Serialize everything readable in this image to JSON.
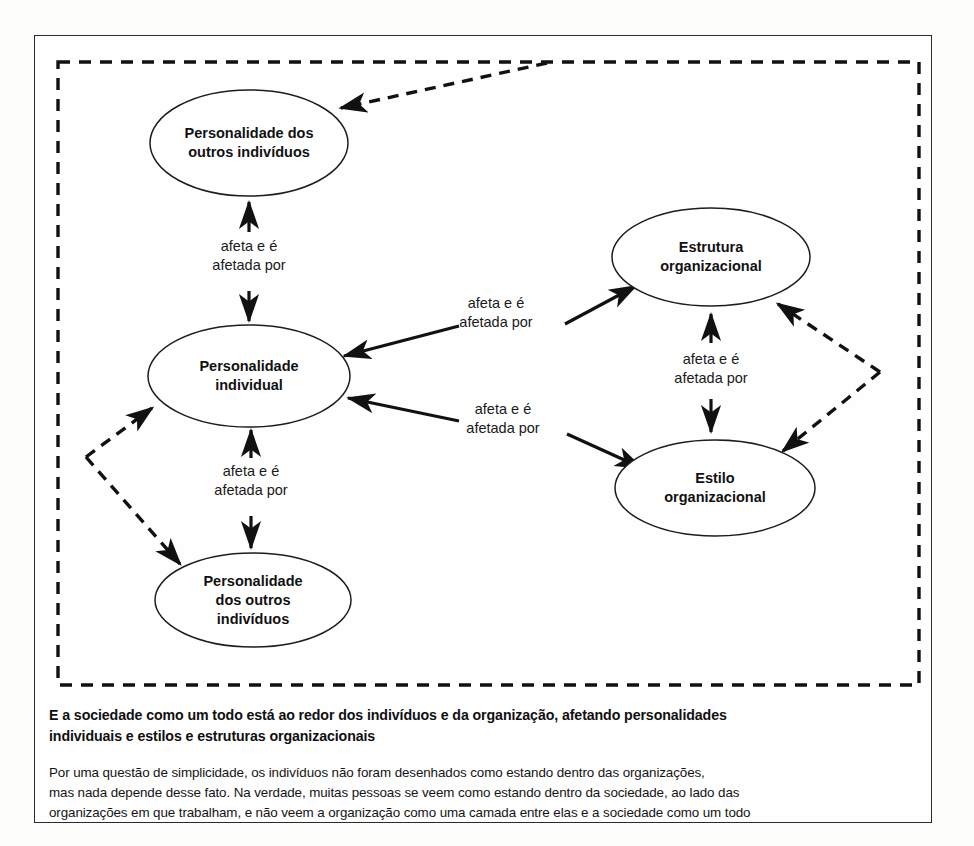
{
  "figure": {
    "type": "relationship-diagram",
    "nodes": [
      {
        "id": "personalidade-outros-topo",
        "lines": [
          "Personalidade dos",
          "outros indivíduos"
        ],
        "cx": 214,
        "cy": 107,
        "rx": 99,
        "ry": 53
      },
      {
        "id": "personalidade-individual",
        "lines": [
          "Personalidade",
          "individual"
        ],
        "cx": 214,
        "cy": 340,
        "rx": 101,
        "ry": 51
      },
      {
        "id": "personalidade-outros-baixo",
        "lines": [
          "Personalidade",
          "dos outros",
          "indivíduos"
        ],
        "cx": 218,
        "cy": 564,
        "rx": 98,
        "ry": 47
      },
      {
        "id": "estrutura-organizacional",
        "lines": [
          "Estrutura",
          "organizacional"
        ],
        "cx": 676,
        "cy": 221,
        "rx": 99,
        "ry": 49
      },
      {
        "id": "estilo-organizacional",
        "lines": [
          "Estilo",
          "organizacional"
        ],
        "cx": 680,
        "cy": 452,
        "rx": 100,
        "ry": 48
      }
    ],
    "edge_labels": [
      {
        "id": "label-topo-esquerda",
        "lines": [
          "afeta e é",
          "afetada por"
        ],
        "x": 214,
        "y": 215
      },
      {
        "id": "label-baixo-esquerda",
        "lines": [
          "afeta e é",
          "afetada por"
        ],
        "x": 216,
        "y": 440
      },
      {
        "id": "label-cruzado-superior",
        "lines": [
          "afeta e é",
          "afetada por"
        ],
        "x": 461,
        "y": 292
      },
      {
        "id": "label-cruzado-inferior",
        "lines": [
          "afeta e é",
          "afetada por"
        ],
        "x": 466,
        "y": 385
      },
      {
        "id": "label-direita-central",
        "lines": [
          "afeta e é",
          "afetada por"
        ],
        "x": 676,
        "y": 328
      }
    ],
    "society_boundary": {
      "id": "sociedade-dashed-boundary",
      "x": 23,
      "y": 26,
      "width": 861,
      "height": 623
    }
  },
  "caption": {
    "bold_lines": [
      "E a sociedade como um todo está ao redor dos indivíduos e da organização, afetando personalidades",
      "individuais e estilos e estruturas organizacionais"
    ],
    "body_lines": [
      "Por uma questão de simplicidade, os indivíduos não foram desenhados como estando dentro das organizações,",
      "mas nada depende desse fato. Na verdade, muitas pessoas se veem como estando dentro da sociedade, ao lado das",
      "organizações em que trabalham, e não veem a organização como uma camada entre elas e a sociedade como um todo"
    ]
  },
  "colors": {
    "stroke": "#111111",
    "page_background": "#fdfdfc",
    "frame_background": "#fefefe",
    "text": "#111111"
  }
}
